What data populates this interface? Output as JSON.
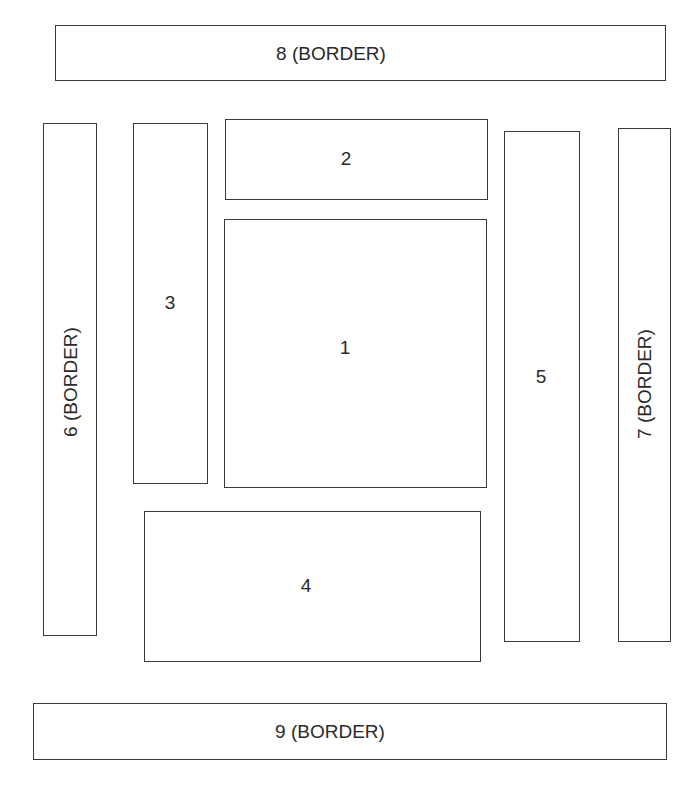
{
  "diagram": {
    "type": "region-layout",
    "regions": [
      {
        "id": "1",
        "label": "1",
        "is_border": false
      },
      {
        "id": "2",
        "label": "2",
        "is_border": false
      },
      {
        "id": "3",
        "label": "3",
        "is_border": false
      },
      {
        "id": "4",
        "label": "4",
        "is_border": false
      },
      {
        "id": "5",
        "label": "5",
        "is_border": false
      },
      {
        "id": "6",
        "label": "6 (BORDER)",
        "is_border": true,
        "orientation": "vertical"
      },
      {
        "id": "7",
        "label": "7 (BORDER)",
        "is_border": true,
        "orientation": "vertical"
      },
      {
        "id": "8",
        "label": "8 (BORDER)",
        "is_border": true,
        "orientation": "horizontal"
      },
      {
        "id": "9",
        "label": "9 (BORDER)",
        "is_border": true,
        "orientation": "horizontal"
      }
    ],
    "colors": {
      "stroke": "#3a3a3a",
      "text": "#2a2a2a",
      "background": "#ffffff"
    }
  }
}
